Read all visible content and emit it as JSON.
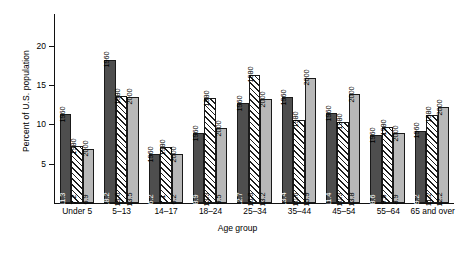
{
  "chart_data": {
    "type": "bar",
    "title": "",
    "xlabel": "Age group",
    "ylabel": "Percent of U.S. population",
    "categories": [
      "Under 5",
      "5–13",
      "14–17",
      "18–24",
      "25–34",
      "35–44",
      "45–54",
      "55–64",
      "65 and over"
    ],
    "series": [
      {
        "name": "1960",
        "style": "solid-dark-gray",
        "color": "#4e4e4e",
        "values": [
          11.3,
          18.2,
          6.2,
          8.9,
          12.7,
          13.4,
          11.4,
          8.6,
          9.2
        ],
        "labels": [
          "11.3",
          "18.2",
          "6.2",
          "8.9",
          "12.7",
          "13.4",
          "11.4",
          "8.6",
          "9.2"
        ]
      },
      {
        "name": "1980",
        "style": "diagonal-hatch",
        "color": "#ffffff",
        "values": [
          7.2,
          13.6,
          7.1,
          13.3,
          16.3,
          10.6,
          10.3,
          9.6,
          11.2
        ],
        "labels": [
          "7.2",
          "13.6",
          "7.1",
          "13.3",
          "16.3",
          "10.6",
          "10.3",
          "9.6",
          "11.2"
        ]
      },
      {
        "name": "2000",
        "style": "solid-light-gray",
        "color": "#b8b8b8",
        "values": [
          6.9,
          13.5,
          6.2,
          9.5,
          13.2,
          15.9,
          13.8,
          8.9,
          12.2
        ],
        "labels": [
          "6.9",
          "13.5",
          "6.2",
          "9.5",
          "13.2",
          "15.9",
          "13.8",
          "8.9",
          "12.2"
        ]
      }
    ],
    "ylim": [
      0,
      24
    ],
    "yticks": [
      5,
      10,
      15,
      20
    ],
    "ytick_labels": [
      "5",
      "10",
      "15",
      "20"
    ],
    "grid": false,
    "legend": "none-inline-year-labels-above-bars"
  }
}
